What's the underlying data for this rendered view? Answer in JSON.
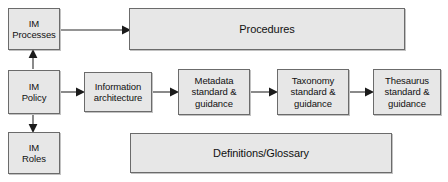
{
  "diagram": {
    "background_color": "#ffffff",
    "node_fill_color": "#e7e7e7",
    "node_border_color": "#6b6b6b",
    "arrow_color": "#1b1b1b",
    "nodes": [
      {
        "id": "im-processes",
        "label": "IM\nProcesses",
        "x": 8,
        "y": 8,
        "w": 52,
        "h": 42,
        "size": "small"
      },
      {
        "id": "procedures",
        "label": "Procedures",
        "x": 129,
        "y": 8,
        "w": 276,
        "h": 42,
        "size": "wide"
      },
      {
        "id": "im-policy",
        "label": "IM\nPolicy",
        "x": 8,
        "y": 70,
        "w": 52,
        "h": 44,
        "size": "small"
      },
      {
        "id": "information-architecture",
        "label": "Information\narchitecture",
        "x": 84,
        "y": 72,
        "w": 68,
        "h": 40,
        "size": "small"
      },
      {
        "id": "metadata-standard-guidance",
        "label": "Metadata\nstandard &\nguidance",
        "x": 178,
        "y": 69,
        "w": 72,
        "h": 46,
        "size": "small"
      },
      {
        "id": "taxonomy-standard-guidance",
        "label": "Taxonomy\nstandard &\nguidance",
        "x": 277,
        "y": 69,
        "w": 72,
        "h": 46,
        "size": "small"
      },
      {
        "id": "thesaurus-standard-guidance",
        "label": "Thesaurus\nstandard &\nguidance",
        "x": 373,
        "y": 69,
        "w": 68,
        "h": 46,
        "size": "small"
      },
      {
        "id": "im-roles",
        "label": "IM\nRoles",
        "x": 8,
        "y": 132,
        "w": 52,
        "h": 42,
        "size": "small"
      },
      {
        "id": "definitions-glossary",
        "label": "Definitions/Glossary",
        "x": 130,
        "y": 133,
        "w": 262,
        "h": 40,
        "size": "wide"
      }
    ],
    "edges": [
      {
        "id": "processes-to-procedures",
        "from": "im-processes",
        "to": "procedures",
        "direction": "right"
      },
      {
        "id": "policy-to-processes",
        "from": "im-policy",
        "to": "im-processes",
        "direction": "up"
      },
      {
        "id": "policy-to-roles",
        "from": "im-policy",
        "to": "im-roles",
        "direction": "down"
      },
      {
        "id": "policy-to-information-architecture",
        "from": "im-policy",
        "to": "information-architecture",
        "direction": "right"
      },
      {
        "id": "information-architecture-to-metadata",
        "from": "information-architecture",
        "to": "metadata-standard-guidance",
        "direction": "right"
      },
      {
        "id": "metadata-to-taxonomy",
        "from": "metadata-standard-guidance",
        "to": "taxonomy-standard-guidance",
        "direction": "right"
      },
      {
        "id": "taxonomy-to-thesaurus",
        "from": "taxonomy-standard-guidance",
        "to": "thesaurus-standard-guidance",
        "direction": "right"
      }
    ]
  }
}
